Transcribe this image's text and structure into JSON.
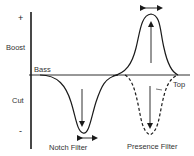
{
  "diagram": {
    "axis_labels": {
      "plus": "+",
      "boost": "Boost",
      "cut": "Cut",
      "minus": "-",
      "bass": "Bass",
      "top": "Top"
    },
    "curves": [
      {
        "name": "Notch Filter",
        "style": "solid",
        "direction": "cut",
        "label": "Notch Filter"
      },
      {
        "name": "Presence Filter (boost)",
        "style": "solid",
        "direction": "boost",
        "label": "Presence Filter"
      },
      {
        "name": "Presence Filter (cut)",
        "style": "dashed",
        "direction": "cut"
      }
    ],
    "labels": {
      "notch_filter": "Notch Filter",
      "presence_filter": "Presence Filter"
    },
    "colors": {
      "line": "#1a1a1a",
      "text": "#333333",
      "background": "#ffffff"
    }
  }
}
